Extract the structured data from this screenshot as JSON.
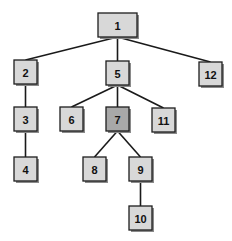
{
  "diagram": {
    "type": "tree",
    "colors": {
      "node_fill": "#d8d8d8",
      "highlight_fill": "#a8a8a8",
      "edge": "#1a1a1a",
      "border": "#1e1e1e"
    },
    "nodes": [
      {
        "id": "1",
        "label": "1",
        "x": 98,
        "y": 13,
        "w": 39,
        "h": 24,
        "highlight": false
      },
      {
        "id": "2",
        "label": "2",
        "x": 14,
        "y": 60,
        "w": 23,
        "h": 24,
        "highlight": false
      },
      {
        "id": "5",
        "label": "5",
        "x": 106,
        "y": 61,
        "w": 23,
        "h": 24,
        "highlight": false
      },
      {
        "id": "12",
        "label": "12",
        "x": 199,
        "y": 62,
        "w": 23,
        "h": 24,
        "highlight": false
      },
      {
        "id": "3",
        "label": "3",
        "x": 14,
        "y": 107,
        "w": 23,
        "h": 24,
        "highlight": false
      },
      {
        "id": "6",
        "label": "6",
        "x": 60,
        "y": 107,
        "w": 23,
        "h": 24,
        "highlight": false
      },
      {
        "id": "7",
        "label": "7",
        "x": 106,
        "y": 107,
        "w": 23,
        "h": 24,
        "highlight": true
      },
      {
        "id": "11",
        "label": "11",
        "x": 152,
        "y": 108,
        "w": 23,
        "h": 24,
        "highlight": false
      },
      {
        "id": "4",
        "label": "4",
        "x": 14,
        "y": 157,
        "w": 23,
        "h": 24,
        "highlight": false
      },
      {
        "id": "8",
        "label": "8",
        "x": 83,
        "y": 157,
        "w": 23,
        "h": 24,
        "highlight": false
      },
      {
        "id": "9",
        "label": "9",
        "x": 129,
        "y": 157,
        "w": 23,
        "h": 24,
        "highlight": false
      },
      {
        "id": "10",
        "label": "10",
        "x": 129,
        "y": 206,
        "w": 23,
        "h": 24,
        "highlight": false
      }
    ],
    "edges": [
      {
        "from": "1",
        "to": "2"
      },
      {
        "from": "1",
        "to": "5"
      },
      {
        "from": "1",
        "to": "12"
      },
      {
        "from": "2",
        "to": "3"
      },
      {
        "from": "3",
        "to": "4"
      },
      {
        "from": "5",
        "to": "6"
      },
      {
        "from": "5",
        "to": "7"
      },
      {
        "from": "5",
        "to": "11"
      },
      {
        "from": "7",
        "to": "8"
      },
      {
        "from": "7",
        "to": "9"
      },
      {
        "from": "9",
        "to": "10"
      }
    ]
  }
}
